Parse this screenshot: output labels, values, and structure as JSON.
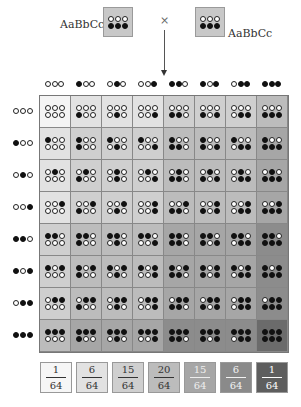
{
  "parents": {
    "left": {
      "label": "AaBbCc",
      "top_row": [
        0,
        0,
        0
      ],
      "bottom_row": [
        1,
        1,
        1
      ]
    },
    "right": {
      "label": "AaBbCc",
      "top_row": [
        0,
        0,
        0
      ],
      "bottom_row": [
        1,
        1,
        1
      ]
    },
    "cross_symbol": "×"
  },
  "gametes": [
    [
      0,
      0,
      0
    ],
    [
      1,
      0,
      0
    ],
    [
      0,
      1,
      0
    ],
    [
      0,
      0,
      1
    ],
    [
      1,
      1,
      0
    ],
    [
      1,
      0,
      1
    ],
    [
      0,
      1,
      1
    ],
    [
      1,
      1,
      1
    ]
  ],
  "cell_colors_by_dark_count": [
    "#f4f4f4",
    "#e2e2e2",
    "#cfcfcf",
    "#bcbcbc",
    "#a6a6a6",
    "#8c8c8c",
    "#6b6b6b"
  ],
  "legend": [
    {
      "num": "1",
      "den": "64",
      "bg": "#f6f6f6",
      "fg": "#333333"
    },
    {
      "num": "6",
      "den": "64",
      "bg": "#e2e2e2",
      "fg": "#333333"
    },
    {
      "num": "15",
      "den": "64",
      "bg": "#cfcfcf",
      "fg": "#333333"
    },
    {
      "num": "20",
      "den": "64",
      "bg": "#bcbcbc",
      "fg": "#333333"
    },
    {
      "num": "15",
      "den": "64",
      "bg": "#a6a6a6",
      "fg": "#eeeeee"
    },
    {
      "num": "6",
      "den": "64",
      "bg": "#8a8a8a",
      "fg": "#f2f2f2"
    },
    {
      "num": "1",
      "den": "64",
      "bg": "#5e5e5e",
      "fg": "#ffffff"
    }
  ]
}
